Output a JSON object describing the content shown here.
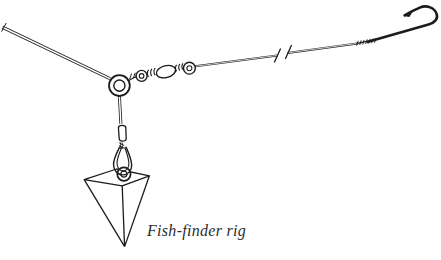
{
  "meta": {
    "background": "#ffffff",
    "ink_color": "#1c1c1c",
    "caption_color": "#2d2d2d"
  },
  "caption": {
    "text": "Fish-finder rig"
  },
  "parts": {
    "main_line": "main-line",
    "slide_ring": "fish-finder-slide-ring",
    "swivel": "barrel-swivel",
    "leader": "leader-line",
    "break_marks": "line-break-marks",
    "snell": "snell-wraps",
    "hook": "fishing-hook",
    "bead": "bead",
    "snap": "snap-clip",
    "sinker_eye": "sinker-eye",
    "sinker": "pyramid-sinker"
  },
  "drawing": {
    "main_line": "M2.5,27.2 L110,78.6",
    "main_line_tick": "M6.2,23 L1.6,31.6",
    "ring_outer": "M109,85.6 a10.4,10.4 0 1,0 20.8,0 a10.4,10.4 0 1,0 -20.8,0",
    "ring_inner": "M113.8,85.6 a5.6,5.6 0 1,0 11.2,0 a5.6,5.6 0 1,0 -11.2,0",
    "ring_link": "M128.8,80.4 C132.2,78.4 134.8,77.2 137.2,76.4",
    "ring_link_wraps": "M131.6,73.6 l-1.9,5.4 M135.2,72.8 l-1.9,5.4 M138.6,72.1 l-1.9,5.2",
    "eye_left_outer": "M136.1,75.9 a5.5,5.5 0 1,0 11,0 a5.5,5.5 0 1,0 -11,0",
    "eye_left_inner": "M139.3,75.9 a2.3,2.3 0 1,0 4.6,0 a2.3,2.3 0 1,0 -4.6,0",
    "coil_left": "M148.6,69.8 c-1.7,1.9 -1.7,5.2 0,7.1 M151.9,68.9 c-1.7,1.9 -1.7,5.2 0,7.1 M155.2,68 c-1.7,1.9 -1.7,5.2 0,7.1",
    "barrel": "M156.5,74.1 A9.8,5.9 -15 1 0 175.5,69.2 A9.8,5.9 -15 1 0 156.5,74.1",
    "coil_right": "M176.6,64.9 c-1.5,1.7 -1.5,4.7 0,6.4 M179.8,64.1 c-1.5,1.7 -1.5,4.7 0,6.4 M183,63.3 c-1.5,1.7 -1.5,4.7 0,6.4",
    "eye_right_outer": "M183.5,68.2 a5.9,5.9 0 1,0 11.8,0 a5.9,5.9 0 1,0 -11.8,0",
    "eye_right_inner": "M186.9,68.2 a2.5,2.5 0 1,0 5,0 a2.5,2.5 0 1,0 -5,0",
    "leader1": "M195.2,66.3 L277.6,55.4",
    "leader2": "M287.6,52.9 L357.6,43.4",
    "break_marks": "M280.6,48.4 L274.3,62.6 M291.6,44.9 L285.3,59.1",
    "snell_base": "M356.4,43.7 L378.4,38.9",
    "snell_wraps": "M358.2,40.9 l-1.5,4.6 M361.2,40.4 l-1.5,4.6 M364.2,39.9 l-1.5,4.6 M367.2,39.4 l-1.5,4.6 M370.2,38.9 l-1.5,4.6 M373.2,38.5 l-1.5,4.6 M376,38.1 l-1.5,4.6",
    "hook": "M368,41.8 L428.5,24.6 C434.8,22.7 438.3,18.9 436.6,13.8 C434.8,8.2 426.9,4.4 419.8,7.6 C414.7,9.9 409.3,12.5 404.6,15.3",
    "hook_barb": "M403.6,16 L413.8,9.8 L409.4,17 Z",
    "drop_wire1": "M119.4,96 L120.9,124",
    "bead": "M118.4,127.6 C118.6,124.6 125.6,124.6 125.8,127.6 L126.2,138.6 C126.3,142 119.3,142 119.2,138.6 Z",
    "drop_wire2": "M121.3,142.4 L121.4,149",
    "snap_twist": "M119.2,142.8 l5,2.8 M119,145.6 l5.2,2.6",
    "snap_outer": "M119.8,146.8 C117.4,151.6 113.9,158 113.5,164 C113.2,169.6 117.4,174.6 122.5,174.9 C127.9,175.2 131.9,170.5 131.7,165 C131.5,159 128.1,151.6 125.9,146.8",
    "snap_inner": "M121.8,147.2 C120,151.6 117.2,157.6 117,162.8 C116.8,167.1 119.9,170.9 123.2,171 C126.7,171.1 129.1,167.5 128.9,163.2 C128.7,158 126.3,151.6 124.7,147.2",
    "pyramid_top": "M84.2,179.6 L116.6,169 L149.4,175.8 L122.2,185.8 Z",
    "pyramid_edges": "M84.2,179.6 L124.6,246.6 M149.4,175.8 L124.6,246.6 M122.2,185.8 L124.6,246.6",
    "sinker_eye_outer": "M117.2,174.1 a6.7,6.7 0 1,0 13.4,0 a6.7,6.7 0 1,0 -13.4,0",
    "sinker_eye_inner": "M120.8,174.1 a3.1,3.1 0 1,0 6.2,0 a3.1,3.1 0 1,0 -6.2,0"
  }
}
